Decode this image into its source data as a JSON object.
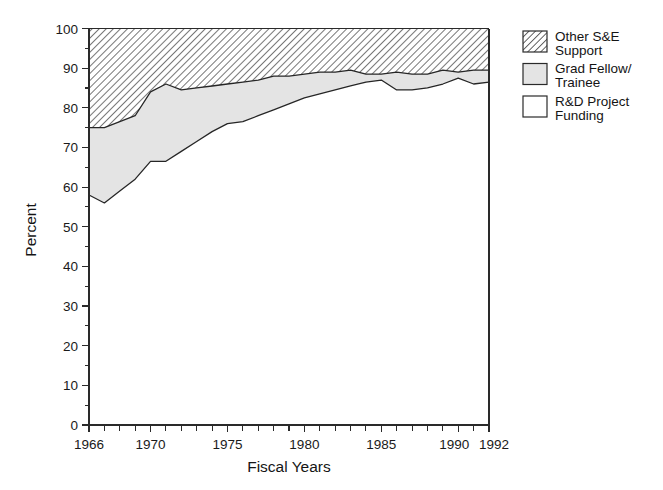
{
  "chart_data": {
    "type": "area",
    "title": "",
    "subtitle": "",
    "xlabel": "Fiscal Years",
    "ylabel": "Percent",
    "stacked": true,
    "normalized_to_100": true,
    "grid": false,
    "legend_position": "right",
    "xlim": [
      1966,
      1992
    ],
    "ylim": [
      0,
      100
    ],
    "ytick_labels": [
      "0",
      "10",
      "20",
      "30",
      "40",
      "50",
      "60",
      "70",
      "80",
      "90",
      "100"
    ],
    "ytick_values": [
      0,
      10,
      20,
      30,
      40,
      50,
      60,
      70,
      80,
      90,
      100
    ],
    "yminor_interval": 5,
    "xtick_labels": [
      "1966",
      "1970",
      "1975",
      "1980",
      "1985",
      "1990",
      "1992"
    ],
    "xtick_values": [
      1966,
      1970,
      1975,
      1980,
      1985,
      1990,
      1992
    ],
    "xminor_interval": 1,
    "x": [
      1966,
      1967,
      1968,
      1969,
      1970,
      1971,
      1972,
      1973,
      1974,
      1975,
      1976,
      1977,
      1978,
      1979,
      1980,
      1981,
      1982,
      1983,
      1984,
      1985,
      1986,
      1987,
      1988,
      1989,
      1990,
      1991,
      1992
    ],
    "series": [
      {
        "name": "R&D Project Funding",
        "legend_label": "R&D Project\nFunding",
        "fill": "#ffffff",
        "pattern": "solid-white",
        "values": [
          58,
          56,
          59,
          62,
          66.5,
          66.5,
          69,
          71.5,
          74,
          76,
          76.5,
          78,
          79.5,
          81,
          82.5,
          83.5,
          84.5,
          85.5,
          86.5,
          87,
          84.5,
          84.5,
          85,
          86,
          87.5,
          86,
          86.5
        ]
      },
      {
        "name": "Grad Fellow/Trainee",
        "legend_label": "Grad Fellow/\nTrainee",
        "fill": "#e4e4e4",
        "pattern": "light-gray",
        "values": [
          17,
          19,
          17.5,
          16,
          17.5,
          19.5,
          15.5,
          13.5,
          11.5,
          10,
          10,
          9,
          8.5,
          7,
          6,
          5.5,
          4.5,
          4,
          2,
          1.5,
          4.5,
          4,
          3.5,
          3.5,
          1.5,
          3.5,
          3
        ]
      },
      {
        "name": "Other S&E Support",
        "legend_label": "Other S&E\nSupport",
        "fill": "#ffffff",
        "pattern": "diagonal-hatch",
        "values": [
          25,
          25,
          23.5,
          22,
          16,
          14,
          15.5,
          15,
          14.5,
          14,
          13.5,
          13,
          12,
          12,
          11.5,
          11,
          11,
          10.5,
          11.5,
          11.5,
          11,
          11.5,
          11.5,
          10.5,
          11,
          10.5,
          10.5
        ]
      }
    ],
    "cumulative_upper_boundaries": {
      "rd_project_funding_top": [
        58,
        56,
        59,
        62,
        66.5,
        66.5,
        69,
        71.5,
        74,
        76,
        76.5,
        78,
        79.5,
        81,
        82.5,
        83.5,
        84.5,
        85.5,
        86.5,
        87,
        84.5,
        84.5,
        85,
        86,
        87.5,
        86,
        86.5
      ],
      "grad_fellow_top": [
        75,
        75,
        76.5,
        78,
        84,
        86,
        84.5,
        85,
        85.5,
        86,
        86.5,
        87,
        88,
        88,
        88.5,
        89,
        89,
        89.5,
        88.5,
        88.5,
        89,
        88.5,
        88.5,
        89.5,
        89,
        89.5,
        89.5
      ],
      "total_top": [
        100,
        100,
        100,
        100,
        100,
        100,
        100,
        100,
        100,
        100,
        100,
        100,
        100,
        100,
        100,
        100,
        100,
        100,
        100,
        100,
        100,
        100,
        100,
        100,
        100,
        100,
        100
      ]
    }
  },
  "legend": {
    "entries": [
      {
        "line1": "Other S&E",
        "line2": "Support",
        "swatch": "diagonal-hatch-swatch"
      },
      {
        "line1": "Grad Fellow/",
        "line2": "Trainee",
        "swatch": "gray-fill-swatch"
      },
      {
        "line1": "R&D Project",
        "line2": "Funding",
        "swatch": "white-fill-swatch"
      }
    ]
  },
  "axes": {
    "y_title": "Percent",
    "x_title": "Fiscal Years"
  },
  "colors": {
    "hatch_stroke": "#4a4a4a",
    "gray_fill": "#e4e4e4",
    "white_fill": "#ffffff",
    "axis": "#2a2a2a",
    "text": "#1a1a1a"
  }
}
